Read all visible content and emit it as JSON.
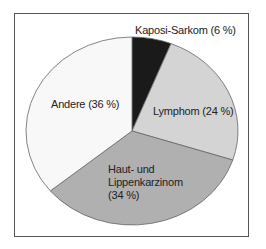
{
  "chart_data": {
    "type": "pie",
    "title": "",
    "slices": [
      {
        "label": "Kaposi-Sarkom",
        "value": 6,
        "display": "Kaposi-Sarkom (6 %)",
        "color": "#1a1a1a"
      },
      {
        "label": "Lymphom",
        "value": 24,
        "display": "Lymphom (24 %)",
        "color": "#d4d4d4"
      },
      {
        "label": "Haut- und Lippenkarzinom",
        "value": 34,
        "display_lines": [
          "Haut- und",
          "Lippenkarzinom",
          "(34 %)"
        ],
        "color": "#b0b0b0"
      },
      {
        "label": "Andere",
        "value": 36,
        "display": "Andere (36 %)",
        "color": "#f8f8f8"
      }
    ],
    "start_angle_deg": 0,
    "direction": "clockwise",
    "legend": "none"
  }
}
